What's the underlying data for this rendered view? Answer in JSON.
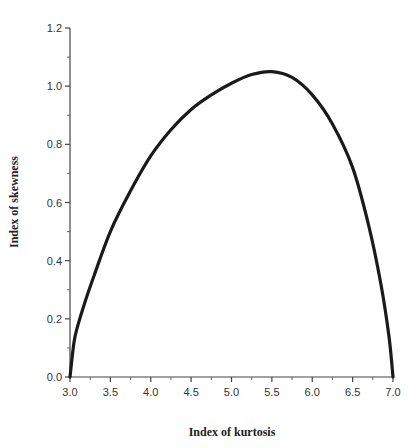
{
  "chart_data": {
    "type": "line",
    "title": "",
    "xlabel": "Index of kurtosis",
    "ylabel": "Index of skewness",
    "xlim": [
      3.0,
      7.0
    ],
    "ylim": [
      0.0,
      1.2
    ],
    "grid": false,
    "legend": null,
    "x_ticks": [
      "3.0",
      "3.5",
      "4.0",
      "4.5",
      "5.0",
      "5.5",
      "6.0",
      "6.5",
      "7.0"
    ],
    "y_ticks": [
      "0.0",
      "0.2",
      "0.4",
      "0.6",
      "0.8",
      "1.0",
      "1.2"
    ],
    "series": [
      {
        "name": "boundary curve",
        "color": "#1a1a1a",
        "x": [
          3.0,
          3.05,
          3.1,
          3.2,
          3.3,
          3.5,
          3.75,
          4.0,
          4.25,
          4.5,
          4.75,
          5.0,
          5.25,
          5.5,
          5.75,
          6.0,
          6.25,
          6.5,
          6.7,
          6.85,
          6.95,
          7.0
        ],
        "y": [
          0.0,
          0.12,
          0.18,
          0.27,
          0.35,
          0.5,
          0.64,
          0.76,
          0.85,
          0.92,
          0.97,
          1.01,
          1.04,
          1.05,
          1.03,
          0.97,
          0.87,
          0.72,
          0.52,
          0.32,
          0.14,
          0.0
        ]
      }
    ]
  }
}
